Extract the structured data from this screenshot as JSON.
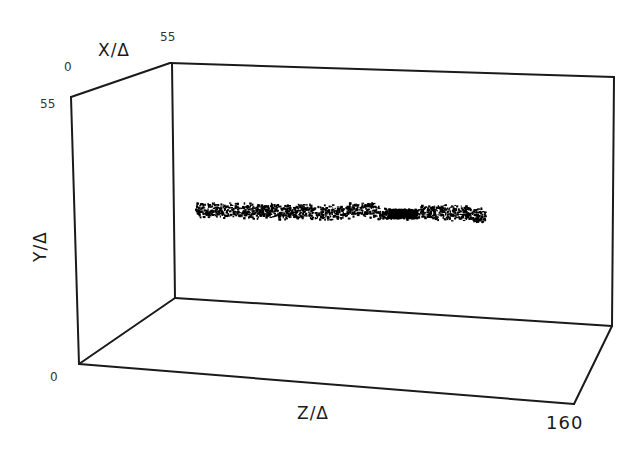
{
  "chart_data": {
    "type": "scatter",
    "projection": "3d-box",
    "title": "",
    "xlabel": "Z/Δ",
    "ylabel": "Y/Δ",
    "zlabel": "X/Δ",
    "axes": {
      "z_axis": {
        "label": "Z/Δ",
        "min": 0,
        "max": 160,
        "tick_labels": [
          "160"
        ]
      },
      "y_axis": {
        "label": "Y/Δ",
        "min": 0,
        "max": 55,
        "tick_labels": [
          "0",
          "55"
        ]
      },
      "x_axis": {
        "label": "X/Δ",
        "min": 0,
        "max": 55,
        "tick_labels": [
          "0",
          "55"
        ]
      }
    },
    "grid": false,
    "legend": null,
    "series": [
      {
        "name": "particle cloud",
        "color": "#000000",
        "description": "Dense horizontal band of dots centered around Y/Δ ≈ 30, spanning Z/Δ ≈ 20 to 130, thickening to a dark blob near Z/Δ ≈ 100",
        "z_range": [
          20,
          130
        ],
        "y_center": 30,
        "y_spread": 3
      }
    ]
  },
  "labels": {
    "x_axis_title": "X/Δ",
    "y_axis_title": "Y/Δ",
    "z_axis_title": "Z/Δ",
    "x_min": "0",
    "x_max": "55",
    "y_min": "0",
    "y_max": "55",
    "z_max": "160"
  }
}
